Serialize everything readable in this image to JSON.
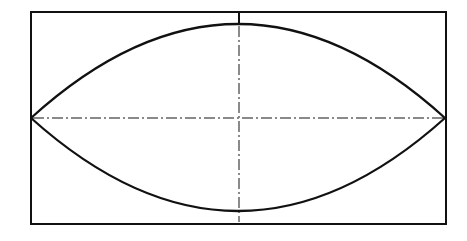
{
  "diagram": {
    "type": "technical-drawing",
    "colors": {
      "background": "#ffffff",
      "outline": "#111111",
      "centerline": "#8a8a8a"
    },
    "frame": {
      "x": 31,
      "y": 12,
      "width": 415,
      "height": 212
    },
    "lens": {
      "left_tip": [
        31,
        118
      ],
      "right_tip": [
        445,
        118
      ],
      "top_apex": [
        239,
        24
      ],
      "bottom_apex": [
        239,
        211
      ]
    },
    "centerlines": {
      "horizontal_y": 118,
      "vertical_x": 239,
      "pattern": "dash-dot"
    }
  }
}
